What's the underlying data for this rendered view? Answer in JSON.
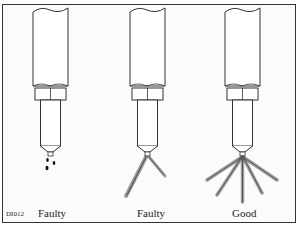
{
  "figure": {
    "code": "DI012",
    "panels": [
      {
        "label": "Faulty",
        "spray": "dripping"
      },
      {
        "label": "Faulty",
        "spray": "uneven-two-jets"
      },
      {
        "label": "Good",
        "spray": "even-fan-spray"
      }
    ]
  },
  "colors": {
    "line": "#333333",
    "background": "#fbfbfb",
    "spray": "#555555"
  }
}
